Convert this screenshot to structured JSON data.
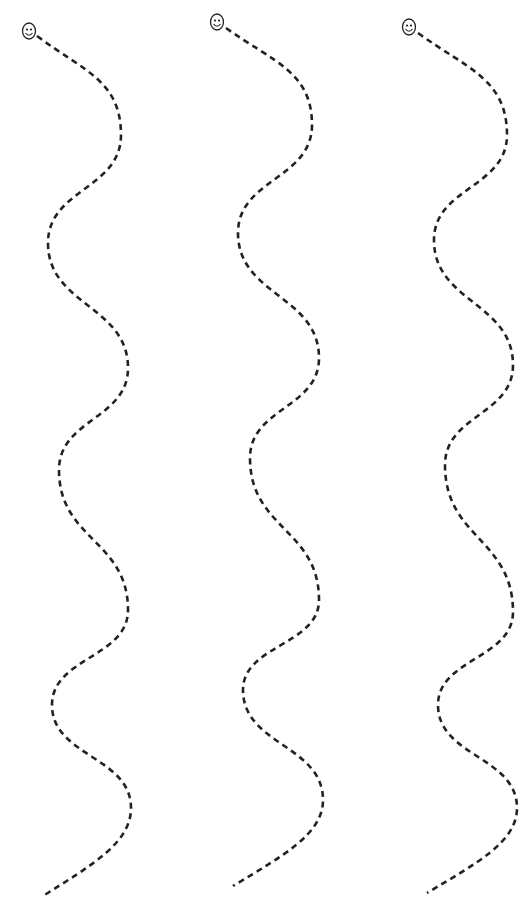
{
  "worksheet": {
    "title_cut_off": "",
    "stroke_color": "#222222",
    "background_color": "#ffffff",
    "tracks": [
      {
        "id": "track-1",
        "start_icon": "smiley-face-icon",
        "smiley": {
          "cx": 29,
          "cy": 31
        },
        "points": [
          [
            37,
            36
          ],
          [
            121,
            135
          ],
          [
            48,
            243
          ],
          [
            128,
            368
          ],
          [
            59,
            470
          ],
          [
            128,
            610
          ],
          [
            52,
            705
          ],
          [
            131,
            808
          ],
          [
            43,
            896
          ]
        ]
      },
      {
        "id": "track-2",
        "start_icon": "smiley-face-icon",
        "smiley": {
          "cx": 217,
          "cy": 22
        },
        "points": [
          [
            226,
            28
          ],
          [
            312,
            125
          ],
          [
            238,
            233
          ],
          [
            319,
            358
          ],
          [
            250,
            458
          ],
          [
            319,
            600
          ],
          [
            243,
            690
          ],
          [
            323,
            800
          ],
          [
            233,
            886
          ]
        ]
      },
      {
        "id": "track-3",
        "start_icon": "smiley-face-icon",
        "smiley": {
          "cx": 409,
          "cy": 27
        },
        "points": [
          [
            418,
            33
          ],
          [
            507,
            135
          ],
          [
            434,
            240
          ],
          [
            513,
            365
          ],
          [
            445,
            465
          ],
          [
            513,
            612
          ],
          [
            438,
            705
          ],
          [
            517,
            808
          ],
          [
            427,
            893
          ]
        ]
      }
    ]
  }
}
